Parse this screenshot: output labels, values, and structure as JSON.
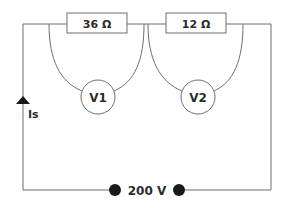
{
  "diagram": {
    "type": "circuit",
    "resistors": [
      {
        "id": "R1",
        "label": "36 Ω",
        "value_ohms": 36
      },
      {
        "id": "R2",
        "label": "12 Ω",
        "value_ohms": 12
      }
    ],
    "voltmeters": [
      {
        "id": "V1",
        "label": "V1",
        "across": "R1"
      },
      {
        "id": "V2",
        "label": "V2",
        "across": "R2"
      }
    ],
    "current": {
      "label": "Is",
      "direction": "up"
    },
    "supply": {
      "label": "200 V",
      "voltage_volts": 200
    },
    "colors": {
      "wire": "#6e6e6e",
      "text": "#2b2b2b",
      "terminal": "#1a1a1a",
      "background": "#ffffff"
    }
  }
}
